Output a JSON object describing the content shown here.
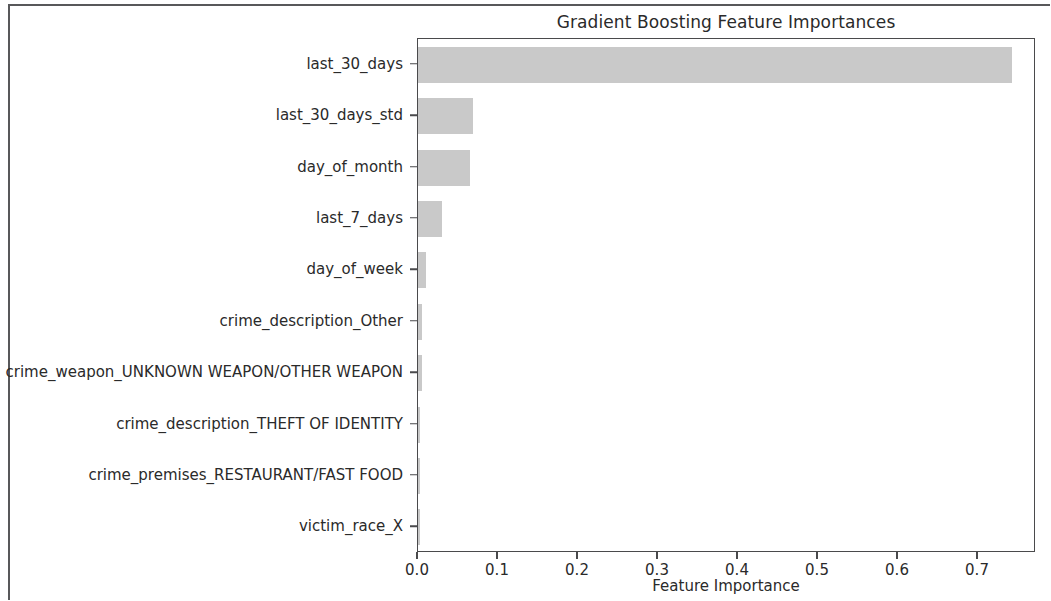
{
  "chart_data": {
    "type": "bar",
    "orientation": "horizontal",
    "title": "Gradient Boosting Feature Importances",
    "xlabel": "Feature Importance",
    "ylabel": "",
    "grid": false,
    "legend": null,
    "xlim": [
      0.0,
      0.7725
    ],
    "xticks": [
      0.0,
      0.1,
      0.2,
      0.3,
      0.4,
      0.5,
      0.6,
      0.7
    ],
    "xtick_labels": [
      "0.0",
      "0.1",
      "0.2",
      "0.3",
      "0.4",
      "0.5",
      "0.6",
      "0.7"
    ],
    "bar_color": "#c9c9c9",
    "categories": [
      "last_30_days",
      "last_30_days_std",
      "day_of_month",
      "last_7_days",
      "day_of_week",
      "crime_description_Other",
      "crime_weapon_UNKNOWN WEAPON/OTHER WEAPON",
      "crime_description_THEFT OF IDENTITY",
      "crime_premises_RESTAURANT/FAST FOOD",
      "victim_race_X"
    ],
    "values": [
      0.7425,
      0.0688,
      0.065,
      0.03,
      0.01,
      0.005,
      0.0045,
      0.003,
      0.0028,
      0.0025
    ]
  },
  "colors": {
    "bar": "#c9c9c9",
    "axis": "#4a4a4c",
    "text": "#2a2a2a",
    "frame": "#58585a",
    "background": "#ffffff"
  }
}
